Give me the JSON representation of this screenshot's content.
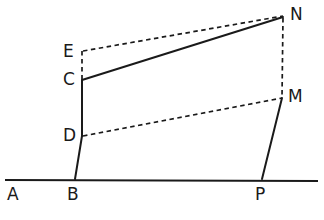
{
  "figure": {
    "background_color": "#ffffff",
    "line_color": "#1a1a1a",
    "width": 324,
    "height": 220,
    "labels": [
      {
        "id": "A",
        "text": "A",
        "x": 7,
        "y": 186
      },
      {
        "id": "B",
        "text": "B",
        "x": 67,
        "y": 186
      },
      {
        "id": "P",
        "text": "P",
        "x": 255,
        "y": 186
      },
      {
        "id": "C",
        "text": "C",
        "x": 63,
        "y": 71
      },
      {
        "id": "D",
        "text": "D",
        "x": 63,
        "y": 127
      },
      {
        "id": "E",
        "text": "E",
        "x": 63,
        "y": 43
      },
      {
        "id": "M",
        "text": "M",
        "x": 288,
        "y": 88
      },
      {
        "id": "N",
        "text": "N",
        "x": 290,
        "y": 6
      }
    ],
    "points": {
      "A": {
        "x": 14,
        "y": 180
      },
      "B": {
        "x": 75,
        "y": 179
      },
      "P": {
        "x": 262,
        "y": 179
      },
      "C": {
        "x": 82,
        "y": 80
      },
      "D": {
        "x": 82,
        "y": 136
      },
      "E": {
        "x": 82,
        "y": 51
      },
      "M": {
        "x": 282,
        "y": 98
      },
      "N": {
        "x": 283,
        "y": 17
      }
    },
    "solid_segments": [
      {
        "name": "baseline-AP",
        "x1": 5,
        "y1": 180,
        "x2": 318,
        "y2": 181
      },
      {
        "name": "segment-B-D",
        "x1": 75,
        "y1": 179,
        "x2": 82,
        "y2": 136
      },
      {
        "name": "segment-D-C",
        "x1": 82,
        "y1": 136,
        "x2": 82,
        "y2": 80
      },
      {
        "name": "segment-C-N",
        "x1": 82,
        "y1": 80,
        "x2": 283,
        "y2": 17
      },
      {
        "name": "segment-M-P",
        "x1": 282,
        "y1": 98,
        "x2": 262,
        "y2": 179
      }
    ],
    "dashed_segments": [
      {
        "name": "segment-E-N",
        "x1": 83,
        "y1": 51,
        "x2": 283,
        "y2": 16
      },
      {
        "name": "segment-E-C",
        "x1": 82,
        "y1": 51,
        "x2": 82,
        "y2": 79
      },
      {
        "name": "segment-D-M",
        "x1": 83,
        "y1": 136,
        "x2": 282,
        "y2": 98
      },
      {
        "name": "segment-N-M",
        "x1": 283,
        "y1": 18,
        "x2": 282,
        "y2": 97
      }
    ]
  }
}
